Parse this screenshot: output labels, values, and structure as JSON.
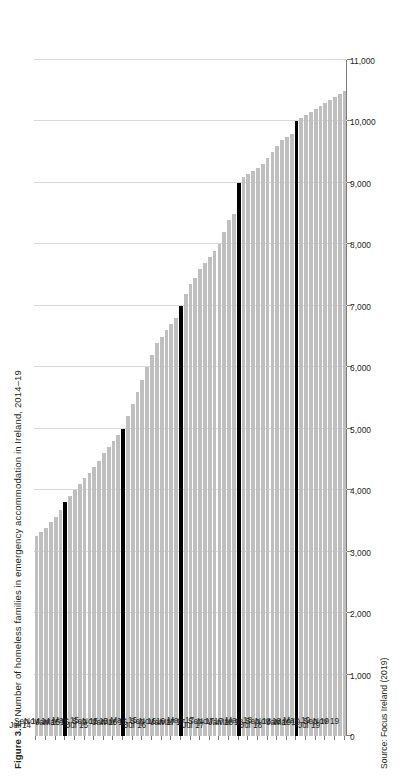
{
  "figure": {
    "label": "Figure 3.1:",
    "title": " Number of homeless families in emergency accommodation in Ireland, 2014–19",
    "source": "Source: Focus Ireland (2019)"
  },
  "chart_data": {
    "type": "bar",
    "orientation": "horizontal",
    "title": "Figure 3.1: Number of homeless families in emergency accommodation in Ireland, 2014–19",
    "subtitle": "",
    "xlabel": "",
    "ylabel": "",
    "source": "Source: Focus Ireland (2019)",
    "grid": true,
    "legend": "none",
    "value_axis": {
      "min": 0,
      "max": 11000,
      "step": 1000,
      "tick_labels": [
        "0",
        "1,000",
        "2,000",
        "3,000",
        "4,000",
        "5,000",
        "6,000",
        "7,000",
        "8,000",
        "9,000",
        "10,000",
        "11,000"
      ],
      "tick_values": [
        0,
        1000,
        2000,
        3000,
        4000,
        5000,
        6000,
        7000,
        8000,
        9000,
        10000,
        11000
      ]
    },
    "colors": {
      "bar": "#bfbfbf",
      "highlight_bar": "#000000",
      "grid": "#d9d9d9",
      "axis": "#7b7b7b",
      "text": "#231f20"
    },
    "highlight_note": "January months shown in black",
    "categories": [
      "Jul 14",
      "Aug 14",
      "Sep 14",
      "Oct 14",
      "Nov 14",
      "Dec 14",
      "Jan 15",
      "Feb 15",
      "Mar 15",
      "Apr 15",
      "May 15",
      "Jun 15",
      "Jul 15",
      "Aug 15",
      "Sep 15",
      "Oct 15",
      "Nov 15",
      "Dec 15",
      "Jan 16",
      "Feb 16",
      "Mar 16",
      "Apr 16",
      "May 16",
      "Jun 16",
      "Jul 16",
      "Aug 16",
      "Sep 16",
      "Oct 16",
      "Nov 16",
      "Dec 16",
      "Jan 17",
      "Feb 17",
      "Mar 17",
      "Apr 17",
      "May 17",
      "Jun 17",
      "Jul 17",
      "Aug 17",
      "Sep 17",
      "Oct 17",
      "Nov 17",
      "Dec 17",
      "Jan 18",
      "Feb 18",
      "Mar 18",
      "Apr 18",
      "May 18",
      "Jun 18",
      "Jul 18",
      "Aug 18",
      "Sep 18",
      "Oct 18",
      "Nov 18",
      "Dec 18",
      "Jan 19",
      "Feb 19",
      "Mar 19",
      "Apr 19",
      "May 19",
      "Jun 19",
      "Jul 19",
      "Aug 19",
      "Sep 19",
      "Oct 19",
      "Nov 19"
    ],
    "tick_categories": [
      "Jul 14",
      "Sep 14",
      "Nov 14",
      "Jan 15",
      "Mar 15",
      "May 15",
      "Jul 15",
      "Sep 15",
      "Nov 15",
      "Jan 16",
      "Mar 16",
      "May 16",
      "Jul 16",
      "Sep 16",
      "Nov 16",
      "Jan 17",
      "Mar 17",
      "May 17",
      "Jul 17",
      "Sep 17",
      "Nov 17",
      "Jan 18",
      "Mar 18",
      "May 18",
      "Jul 18",
      "Sep 18",
      "Nov 18",
      "Jan 19",
      "Mar 19",
      "May 19",
      "Jul 19",
      "Sep 19",
      "Nov 19"
    ],
    "values": [
      3258,
      3320,
      3390,
      3480,
      3560,
      3680,
      3800,
      3900,
      4000,
      4100,
      4200,
      4280,
      4380,
      4480,
      4600,
      4700,
      4800,
      4900,
      5000,
      5200,
      5400,
      5600,
      5800,
      6000,
      6200,
      6400,
      6500,
      6600,
      6700,
      6800,
      7000,
      7200,
      7350,
      7450,
      7600,
      7700,
      7800,
      7900,
      8000,
      8200,
      8400,
      8500,
      9000,
      9100,
      9150,
      9200,
      9250,
      9300,
      9400,
      9500,
      9600,
      9700,
      9750,
      9800,
      10000,
      10050,
      10100,
      10150,
      10200,
      10250,
      10300,
      10350,
      10400,
      10450,
      10500
    ],
    "highlight_indices": [
      6,
      18,
      30,
      42,
      54
    ],
    "notable_points": [
      {
        "label": "Jul 14",
        "value": 3258
      },
      {
        "label": "Jan 15",
        "value": 3800
      },
      {
        "label": "Jan 16",
        "value": 5000
      },
      {
        "label": "Jan 17",
        "value": 7000
      },
      {
        "label": "Jan 18",
        "value": 9000
      },
      {
        "label": "Jan 19",
        "value": 10000
      },
      {
        "label": "Nov 19",
        "value": 10500
      }
    ]
  }
}
